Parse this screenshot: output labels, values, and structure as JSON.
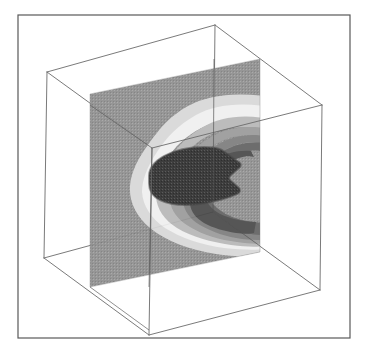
{
  "figure": {
    "background_color": "#ffffff",
    "width": 368,
    "height": 354
  },
  "frame": {
    "label": "plot-border",
    "x": 18,
    "y": 15,
    "width": 332,
    "height": 323,
    "stroke_color": "#595959",
    "stroke_width": 1.2,
    "fill": "none"
  },
  "cube": {
    "label": "wireframe-bounding-box",
    "stroke_color": "#6b6b6b",
    "stroke_width": 0.9,
    "vertices": {
      "back_top_left": [
        47,
        72
      ],
      "back_top_right": [
        215,
        25
      ],
      "back_bottom_left": [
        44,
        258
      ],
      "back_bottom_right": [
        213,
        212
      ],
      "front_top_left": [
        152,
        148
      ],
      "front_top_right": [
        322,
        105
      ],
      "front_bottom_left": [
        149,
        335
      ],
      "front_bottom_right": [
        320,
        290
      ]
    },
    "edges": [
      "back-top",
      "back-bottom",
      "back-left",
      "back-right",
      "front-top",
      "front-bottom",
      "front-left",
      "front-right",
      "connect-top-left",
      "connect-top-right",
      "connect-bottom-left",
      "connect-bottom-right"
    ]
  },
  "slice": {
    "label": "contour-slice-plane",
    "orientation": "vertical-xz-plane",
    "corners": {
      "top_left": [
        90,
        94
      ],
      "top_right": [
        260,
        59
      ],
      "bottom_right": [
        260,
        252
      ],
      "bottom_left": [
        90,
        287
      ]
    },
    "opacity": 0.93
  },
  "chart_data": {
    "type": "heatmap",
    "xlabel": "",
    "ylabel": "",
    "zlabel": "",
    "legend_position": "none",
    "grid": false,
    "colormap": "grayscale",
    "rendering": "filled-contour-with-dither",
    "n_levels": 9,
    "levels": [
      0.0,
      0.125,
      0.25,
      0.375,
      0.5,
      0.625,
      0.75,
      0.875,
      1.0
    ],
    "level_colors": [
      "#2f2f2f",
      "#4a4a4a",
      "#636363",
      "#7d7d7d",
      "#9a9a9a",
      "#b8b8b8",
      "#d8d8d8",
      "#efefef",
      "#8f8f8f"
    ],
    "level_labels": [
      "core (max)",
      "band-8",
      "band-7",
      "band-6",
      "band-5",
      "band-4",
      "band-3 (light ring)",
      "band-2 (white ring)",
      "outer field"
    ],
    "structure_description": "Concentric closed contour bands forming an elongated lobe open to the right; darkest dithered core near plane center-left, surrounded by progressively lighter rings, with a bright near-white ring separating the lobe from the mid-gray outer field",
    "core_center_uv": [
      0.42,
      0.5
    ],
    "core_extent_uv": [
      0.36,
      0.27
    ],
    "annotations": []
  },
  "colors": {
    "background": "#ffffff",
    "frame_stroke": "#595959",
    "cube_stroke": "#6b6b6b",
    "field_base": "#8f8f8f",
    "core_dark": "#2f2f2f",
    "ring_white": "#efefef"
  }
}
